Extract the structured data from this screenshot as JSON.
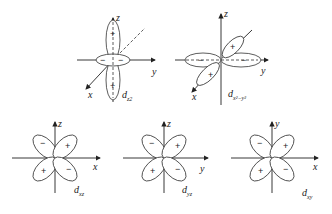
{
  "figure": {
    "orbitals": [
      {
        "id": "dz2",
        "label_main": "d",
        "label_sub": "z2",
        "axes": [
          "z",
          "y",
          "x"
        ],
        "signs": [
          "+",
          "+",
          "−",
          "−"
        ]
      },
      {
        "id": "dx2-y2",
        "label_main": "d",
        "label_sub": "x²−y²",
        "axes": [
          "z",
          "y",
          "x"
        ],
        "signs": [
          "+",
          "+",
          "−",
          "−"
        ]
      },
      {
        "id": "dxz",
        "label_main": "d",
        "label_sub": "xz",
        "axes": [
          "z",
          "x"
        ],
        "signs": [
          "−",
          "+",
          "+",
          "−"
        ]
      },
      {
        "id": "dyz",
        "label_main": "d",
        "label_sub": "yz",
        "axes": [
          "z",
          "y"
        ],
        "signs": [
          "−",
          "+",
          "+",
          "−"
        ]
      },
      {
        "id": "dxy",
        "label_main": "d",
        "label_sub": "xy",
        "axes": [
          "y",
          "x"
        ],
        "signs": [
          "−",
          "+",
          "+",
          "−"
        ]
      }
    ]
  }
}
